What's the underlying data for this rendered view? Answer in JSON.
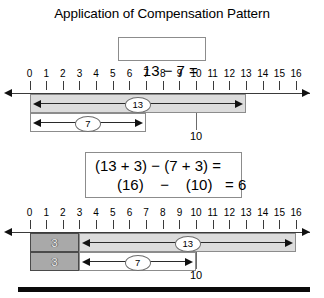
{
  "title": "Application of Compensation Pattern",
  "equation_top": "13 − 7 =",
  "equation_bottom": {
    "line1": "(13 + 3) − (7 + 3) =",
    "line2": "(16)    −    (10)   = 6"
  },
  "axis": {
    "tick_labels": [
      "0",
      "1",
      "2",
      "3",
      "4",
      "5",
      "6",
      "7",
      "8",
      "9",
      "10",
      "11",
      "12",
      "13",
      "14",
      "15",
      "16"
    ],
    "min": 0,
    "max": 16
  },
  "diagram_top": {
    "bars": [
      {
        "label": "13",
        "start": 0,
        "end": 13,
        "shade": "light"
      },
      {
        "label": "7",
        "start": 0,
        "end": 7,
        "shade": "none"
      }
    ],
    "marker": {
      "value": 10,
      "caption": "10"
    }
  },
  "diagram_bottom": {
    "blocks": [
      {
        "label": "3",
        "start": 0,
        "end": 3,
        "shade": "mid"
      },
      {
        "label": "3",
        "start": 0,
        "end": 3,
        "shade": "mid"
      }
    ],
    "bars": [
      {
        "label": "13",
        "start": 3,
        "end": 16,
        "shade": "light"
      },
      {
        "label": "7",
        "start": 3,
        "end": 10,
        "shade": "none"
      }
    ],
    "marker": {
      "value": 10,
      "caption": "10"
    }
  },
  "colors": {
    "shade_light": "#dcdcdc",
    "shade_mid": "#a9a9a9",
    "line": "#8c8c8c",
    "ink": "#000000",
    "bottom_rule": "#0b0b0b"
  }
}
